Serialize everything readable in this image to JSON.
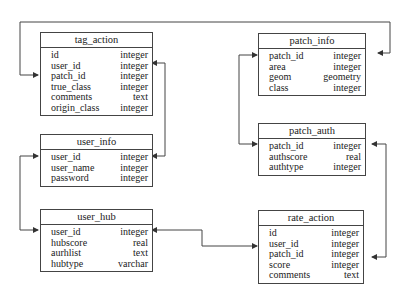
{
  "tables": {
    "tag_action": {
      "title": "tag_action",
      "rows": [
        [
          "id",
          "integer"
        ],
        [
          "user_id",
          "integer"
        ],
        [
          "patch_id",
          "integer"
        ],
        [
          "true_class",
          "integer"
        ],
        [
          "comments",
          "text"
        ],
        [
          "origin_class",
          "integer"
        ]
      ]
    },
    "user_info": {
      "title": "user_info",
      "rows": [
        [
          "user_id",
          "integer"
        ],
        [
          "user_name",
          "integer"
        ],
        [
          "password",
          "integer"
        ]
      ]
    },
    "user_hub": {
      "title": "user_hub",
      "rows": [
        [
          "user_id",
          "integer"
        ],
        [
          "hubscore",
          "real"
        ],
        [
          "aurhlist",
          "text"
        ],
        [
          "hubtype",
          "varchar"
        ]
      ]
    },
    "patch_info": {
      "title": "patch_info",
      "rows": [
        [
          "patch_id",
          "integer"
        ],
        [
          "area",
          "integer"
        ],
        [
          "geom",
          "geometry"
        ],
        [
          "class",
          "integer"
        ]
      ]
    },
    "patch_auth": {
      "title": "patch_auth",
      "rows": [
        [
          "patch_id",
          "integer"
        ],
        [
          "authscore",
          "real"
        ],
        [
          "authtype",
          "integer"
        ]
      ]
    },
    "rate_action": {
      "title": "rate_action",
      "rows": [
        [
          "id",
          "integer"
        ],
        [
          "user_id",
          "integer"
        ],
        [
          "patch_id",
          "integer"
        ],
        [
          "score",
          "integer"
        ],
        [
          "comments",
          "text"
        ]
      ]
    }
  },
  "relations": [
    {
      "from": "patch_info.patch_id",
      "to": "tag_action.patch_id"
    },
    {
      "from": "user_info.user_id",
      "to": "tag_action.user_id"
    },
    {
      "from": "user_info.user_id",
      "to": "user_hub.user_id"
    },
    {
      "from": "patch_info.patch_id",
      "to": "patch_auth.patch_id"
    },
    {
      "from": "patch_auth.patch_id",
      "to": "rate_action.patch_id"
    },
    {
      "from": "user_hub.user_id",
      "to": "rate_action.user_id"
    }
  ]
}
